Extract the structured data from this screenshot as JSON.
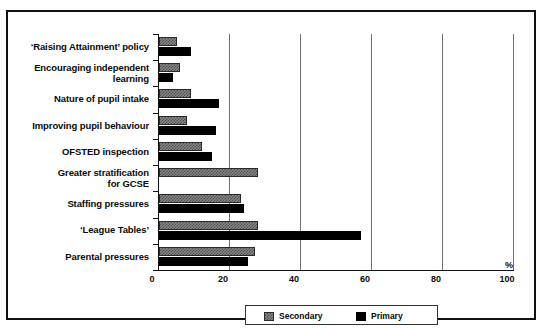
{
  "chart_data": {
    "type": "bar",
    "orientation": "horizontal",
    "title": "",
    "xlabel": "%",
    "ylabel": "",
    "xlim": [
      0,
      100
    ],
    "xticks": [
      0,
      20,
      40,
      60,
      80,
      100
    ],
    "xtick_labels": [
      "0",
      "20",
      "40",
      "60",
      "80",
      "100"
    ],
    "grid": true,
    "grid_axis": "x",
    "legend_position": "bottom",
    "categories": [
      "‘Raising Attainment’ policy",
      "Encouraging independent\nlearning",
      "Nature of pupil intake",
      "Improving pupil behaviour",
      "OFSTED inspection",
      "Greater stratification\nfor GCSE",
      "Staffing pressures",
      "‘League Tables’",
      "Parental  pressures"
    ],
    "series": [
      {
        "name": "Secondary",
        "color": "#8a8a8a",
        "pattern": "checker-dither",
        "values": [
          5,
          6,
          9,
          8,
          12,
          28,
          23,
          28,
          27
        ]
      },
      {
        "name": "Primary",
        "color": "#000000",
        "pattern": "solid",
        "values": [
          9,
          4,
          17,
          16,
          15,
          0,
          24,
          57,
          25
        ]
      }
    ]
  },
  "axis": {
    "percent_symbol": "%"
  },
  "legend": {
    "entries": [
      {
        "label": "Secondary",
        "swatch": "secondary"
      },
      {
        "label": "Primary",
        "swatch": "primary"
      }
    ]
  }
}
